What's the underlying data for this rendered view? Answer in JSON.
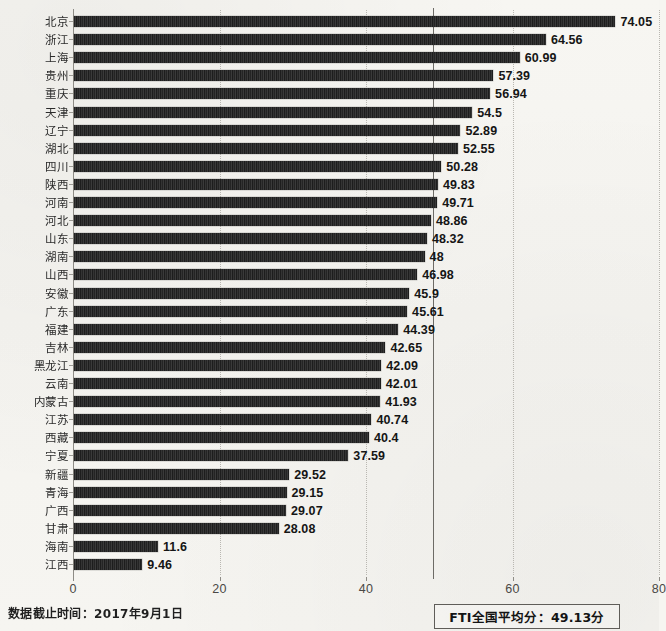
{
  "chart_data": {
    "type": "bar",
    "orientation": "horizontal",
    "title": "",
    "xlabel": "",
    "ylabel": "",
    "xlim": [
      0,
      80
    ],
    "xticks": [
      0,
      20,
      40,
      60,
      80
    ],
    "grid": true,
    "legend_position": "bottom-right",
    "categories": [
      "北京",
      "浙江",
      "上海",
      "贵州",
      "重庆",
      "天津",
      "辽宁",
      "湖北",
      "四川",
      "陕西",
      "河南",
      "河北",
      "山东",
      "湖南",
      "山西",
      "安徽",
      "广东",
      "福建",
      "吉林",
      "黑龙江",
      "云南",
      "内蒙古",
      "江苏",
      "西藏",
      "宁夏",
      "新疆",
      "青海",
      "广西",
      "甘肃",
      "海南",
      "江西"
    ],
    "values": [
      74.05,
      64.56,
      60.99,
      57.39,
      56.94,
      54.5,
      52.89,
      52.55,
      50.28,
      49.83,
      49.71,
      48.86,
      48.32,
      48,
      46.98,
      45.9,
      45.61,
      44.39,
      42.65,
      42.09,
      42.01,
      41.93,
      40.74,
      40.4,
      37.59,
      29.52,
      29.15,
      29.07,
      28.08,
      11.6,
      9.46
    ],
    "value_labels": [
      "74.05",
      "64.56",
      "60.99",
      "57.39",
      "56.94",
      "54.5",
      "52.89",
      "52.55",
      "50.28",
      "49.83",
      "49.71",
      "48.86",
      "48.32",
      "48",
      "46.98",
      "45.9",
      "45.61",
      "44.39",
      "42.65",
      "42.09",
      "42.01",
      "41.93",
      "40.74",
      "40.4",
      "37.59",
      "29.52",
      "29.15",
      "29.07",
      "28.08",
      "11.6",
      "9.46"
    ],
    "annotations": [
      {
        "name": "national-average-line",
        "value": 49.13,
        "label": "FTI全国平均分：49.13分"
      }
    ],
    "bar_color": "#262626",
    "grid_color": "#b9b7b1",
    "average_line_color": "#6d6b66"
  },
  "legend": {
    "average_box_label": "FTI全国平均分：49.13分"
  },
  "footer": {
    "note": "数据截止时间：2017年9月1日"
  }
}
